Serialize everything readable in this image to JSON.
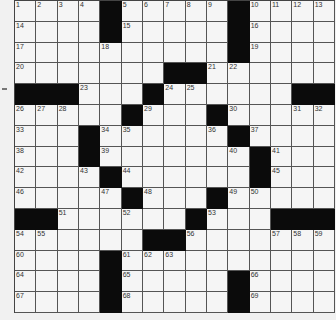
{
  "puzzle": {
    "rows": 15,
    "cols": 15,
    "colors": {
      "black": "#0b0b0b",
      "white": "#f5f5f5",
      "line": "#555555"
    },
    "blocks": [
      [
        0,
        4
      ],
      [
        0,
        10
      ],
      [
        1,
        4
      ],
      [
        1,
        10
      ],
      [
        2,
        10
      ],
      [
        3,
        7
      ],
      [
        3,
        8
      ],
      [
        4,
        0
      ],
      [
        4,
        1
      ],
      [
        4,
        2
      ],
      [
        4,
        6
      ],
      [
        4,
        13
      ],
      [
        4,
        14
      ],
      [
        5,
        5
      ],
      [
        5,
        9
      ],
      [
        6,
        3
      ],
      [
        6,
        10
      ],
      [
        7,
        3
      ],
      [
        7,
        11
      ],
      [
        8,
        4
      ],
      [
        8,
        11
      ],
      [
        9,
        5
      ],
      [
        9,
        9
      ],
      [
        10,
        0
      ],
      [
        10,
        1
      ],
      [
        10,
        8
      ],
      [
        10,
        12
      ],
      [
        10,
        13
      ],
      [
        10,
        14
      ],
      [
        11,
        6
      ],
      [
        11,
        7
      ],
      [
        12,
        4
      ],
      [
        13,
        4
      ],
      [
        13,
        10
      ],
      [
        14,
        4
      ],
      [
        14,
        10
      ]
    ],
    "numbers": [
      {
        "n": "1",
        "r": 0,
        "c": 0
      },
      {
        "n": "2",
        "r": 0,
        "c": 1
      },
      {
        "n": "3",
        "r": 0,
        "c": 2
      },
      {
        "n": "4",
        "r": 0,
        "c": 3
      },
      {
        "n": "5",
        "r": 0,
        "c": 5
      },
      {
        "n": "6",
        "r": 0,
        "c": 6
      },
      {
        "n": "7",
        "r": 0,
        "c": 7
      },
      {
        "n": "8",
        "r": 0,
        "c": 8
      },
      {
        "n": "9",
        "r": 0,
        "c": 9
      },
      {
        "n": "10",
        "r": 0,
        "c": 11
      },
      {
        "n": "11",
        "r": 0,
        "c": 12
      },
      {
        "n": "12",
        "r": 0,
        "c": 13
      },
      {
        "n": "13",
        "r": 0,
        "c": 14
      },
      {
        "n": "14",
        "r": 1,
        "c": 0
      },
      {
        "n": "15",
        "r": 1,
        "c": 5
      },
      {
        "n": "16",
        "r": 1,
        "c": 11
      },
      {
        "n": "17",
        "r": 2,
        "c": 0
      },
      {
        "n": "18",
        "r": 2,
        "c": 4
      },
      {
        "n": "19",
        "r": 2,
        "c": 11
      },
      {
        "n": "20",
        "r": 3,
        "c": 0
      },
      {
        "n": "21",
        "r": 3,
        "c": 9
      },
      {
        "n": "22",
        "r": 3,
        "c": 10
      },
      {
        "n": "23",
        "r": 4,
        "c": 3
      },
      {
        "n": "24",
        "r": 4,
        "c": 7
      },
      {
        "n": "25",
        "r": 4,
        "c": 8
      },
      {
        "n": "26",
        "r": 5,
        "c": 0
      },
      {
        "n": "27",
        "r": 5,
        "c": 1
      },
      {
        "n": "28",
        "r": 5,
        "c": 2
      },
      {
        "n": "29",
        "r": 5,
        "c": 6
      },
      {
        "n": "30",
        "r": 5,
        "c": 10
      },
      {
        "n": "31",
        "r": 5,
        "c": 13
      },
      {
        "n": "32",
        "r": 5,
        "c": 14
      },
      {
        "n": "33",
        "r": 6,
        "c": 0
      },
      {
        "n": "34",
        "r": 6,
        "c": 4
      },
      {
        "n": "35",
        "r": 6,
        "c": 5
      },
      {
        "n": "36",
        "r": 6,
        "c": 9
      },
      {
        "n": "37",
        "r": 6,
        "c": 11
      },
      {
        "n": "38",
        "r": 7,
        "c": 0
      },
      {
        "n": "39",
        "r": 7,
        "c": 4
      },
      {
        "n": "40",
        "r": 7,
        "c": 10
      },
      {
        "n": "41",
        "r": 7,
        "c": 12
      },
      {
        "n": "42",
        "r": 8,
        "c": 0
      },
      {
        "n": "43",
        "r": 8,
        "c": 3
      },
      {
        "n": "44",
        "r": 8,
        "c": 5
      },
      {
        "n": "45",
        "r": 8,
        "c": 12
      },
      {
        "n": "46",
        "r": 9,
        "c": 0
      },
      {
        "n": "47",
        "r": 9,
        "c": 4
      },
      {
        "n": "48",
        "r": 9,
        "c": 6
      },
      {
        "n": "49",
        "r": 9,
        "c": 10
      },
      {
        "n": "50",
        "r": 9,
        "c": 11
      },
      {
        "n": "51",
        "r": 10,
        "c": 2
      },
      {
        "n": "52",
        "r": 10,
        "c": 5
      },
      {
        "n": "53",
        "r": 10,
        "c": 9
      },
      {
        "n": "54",
        "r": 11,
        "c": 0
      },
      {
        "n": "55",
        "r": 11,
        "c": 1
      },
      {
        "n": "56",
        "r": 11,
        "c": 8
      },
      {
        "n": "57",
        "r": 11,
        "c": 12
      },
      {
        "n": "58",
        "r": 11,
        "c": 13
      },
      {
        "n": "59",
        "r": 11,
        "c": 14
      },
      {
        "n": "60",
        "r": 12,
        "c": 0
      },
      {
        "n": "61",
        "r": 12,
        "c": 5
      },
      {
        "n": "62",
        "r": 12,
        "c": 6
      },
      {
        "n": "63",
        "r": 12,
        "c": 7
      },
      {
        "n": "64",
        "r": 13,
        "c": 0
      },
      {
        "n": "65",
        "r": 13,
        "c": 5
      },
      {
        "n": "66",
        "r": 13,
        "c": 11
      },
      {
        "n": "67",
        "r": 14,
        "c": 0
      },
      {
        "n": "68",
        "r": 14,
        "c": 5
      },
      {
        "n": "69",
        "r": 14,
        "c": 11
      }
    ]
  }
}
